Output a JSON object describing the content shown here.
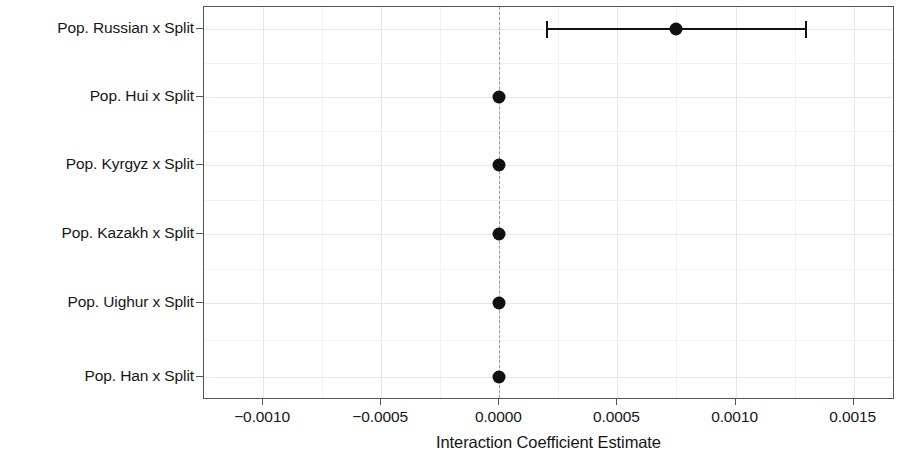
{
  "chart_data": {
    "type": "scatter",
    "title": "",
    "subtitle": "",
    "xlabel": "Interaction Coefficient Estimate",
    "ylabel": "",
    "orientation": "horizontal",
    "grid": true,
    "legend": null,
    "xlim": [
      -0.00125,
      0.001675
    ],
    "xticks": [
      -0.001,
      -0.0005,
      0.0,
      0.0005,
      0.001,
      0.0015
    ],
    "xticklabels": [
      "−0.0010",
      "−0.0005",
      "0.0000",
      "0.0005",
      "0.0010",
      "0.0015"
    ],
    "reference_line": {
      "x": 0.0,
      "style": "dashed",
      "color": "#9a9a9a"
    },
    "categories": [
      "Pop. Russian x Split",
      "Pop. Hui x Split",
      "Pop. Kyrgyz x Split",
      "Pop. Kazakh x Split",
      "Pop. Uighur x Split",
      "Pop. Han x Split"
    ],
    "points": [
      {
        "label": "Pop. Russian x Split",
        "estimate": 0.00075,
        "ci_low": 0.0002,
        "ci_high": 0.0013
      },
      {
        "label": "Pop. Hui x Split",
        "estimate": 0.0,
        "ci_low": 0.0,
        "ci_high": 0.0
      },
      {
        "label": "Pop. Kyrgyz x Split",
        "estimate": 0.0,
        "ci_low": 0.0,
        "ci_high": 0.0
      },
      {
        "label": "Pop. Kazakh x Split",
        "estimate": 0.0,
        "ci_low": 0.0,
        "ci_high": 0.0
      },
      {
        "label": "Pop. Uighur x Split",
        "estimate": 0.0,
        "ci_low": 0.0,
        "ci_high": 0.0
      },
      {
        "label": "Pop. Han x Split",
        "estimate": 0.0,
        "ci_low": 0.0,
        "ci_high": 0.0
      }
    ],
    "marker_color": "#111111",
    "errorbar_color": "#111111",
    "gridline_color": "#e8e8e8",
    "panel_border_color": "#555555",
    "background_color": "#ffffff"
  }
}
